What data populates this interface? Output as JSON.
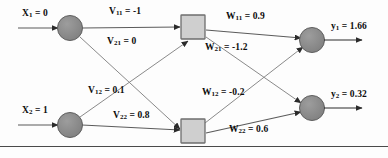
{
  "diagram": {
    "type": "neural-network",
    "colors": {
      "node_fill": "#8c8c8c",
      "node_stroke": "#5a5a5a",
      "hidden_fill": "#cfcfcf",
      "hidden_stroke": "#6e6e6e",
      "edge": "#5b5b5b",
      "text": "#0d0d0d",
      "rule": "#4a4a4a",
      "background": "#fdfdfd"
    },
    "inputs": [
      {
        "id": "x1",
        "name": "X",
        "sub": "1",
        "eq": " = 0",
        "value": 0,
        "cx": 70,
        "cy": 28
      },
      {
        "id": "x2",
        "name": "X",
        "sub": "2",
        "eq": " = 1",
        "value": 1,
        "cx": 70,
        "cy": 125
      }
    ],
    "hidden": [
      {
        "id": "h1",
        "cx": 193,
        "cy": 27,
        "size": 24
      },
      {
        "id": "h2",
        "cx": 193,
        "cy": 131,
        "size": 24
      }
    ],
    "outputs": [
      {
        "id": "y1",
        "name": "y",
        "sub": "1",
        "eq": " = 1.66",
        "value": 1.66,
        "cx": 312,
        "cy": 40
      },
      {
        "id": "y2",
        "name": "y",
        "sub": "2",
        "eq": " = 0.32",
        "value": 0.32,
        "cx": 312,
        "cy": 108
      }
    ],
    "input_arrows": [
      {
        "id": "arrow-x1",
        "x1": 18,
        "y1": 28,
        "x2": 58,
        "y2": 28
      },
      {
        "id": "arrow-x2",
        "x1": 18,
        "y1": 125,
        "x2": 58,
        "y2": 125
      }
    ],
    "output_arrows": [
      {
        "id": "arrow-y1",
        "x1": 324,
        "y1": 40,
        "x2": 364,
        "y2": 40
      },
      {
        "id": "arrow-y2",
        "x1": 324,
        "y1": 108,
        "x2": 364,
        "y2": 108
      }
    ],
    "v_weights": [
      {
        "id": "v11",
        "name": "V",
        "sub": "11",
        "eq": " = -1",
        "value": -1,
        "from": "x1",
        "to": "h1",
        "x1": 82,
        "y1": 28,
        "x2": 180,
        "y2": 27,
        "lx": 110,
        "ly": 8
      },
      {
        "id": "v21",
        "name": "V",
        "sub": "21",
        "eq": " = 0",
        "value": 0,
        "from": "x1",
        "to": "h2",
        "x1": 80,
        "y1": 36,
        "x2": 180,
        "y2": 128,
        "lx": 108,
        "ly": 38
      },
      {
        "id": "v12",
        "name": "V",
        "sub": "12",
        "eq": " = 0.1",
        "value": 0.1,
        "from": "x2",
        "to": "h1",
        "x1": 80,
        "y1": 118,
        "x2": 188,
        "y2": 40,
        "lx": 88,
        "ly": 87
      },
      {
        "id": "v22",
        "name": "V",
        "sub": "22",
        "eq": " = 0.8",
        "value": 0.8,
        "from": "x2",
        "to": "h2",
        "x1": 82,
        "y1": 125,
        "x2": 180,
        "y2": 130,
        "lx": 113,
        "ly": 112
      }
    ],
    "w_weights": [
      {
        "id": "w11",
        "name": "W",
        "sub": "11",
        "eq": " = 0.9",
        "value": 0.9,
        "from": "h1",
        "to": "y1",
        "x1": 206,
        "y1": 30,
        "x2": 300,
        "y2": 38,
        "lx": 228,
        "ly": 13
      },
      {
        "id": "w21",
        "name": "W",
        "sub": "21",
        "eq": " = -1.2",
        "value": -1.2,
        "from": "h1",
        "to": "y2",
        "x1": 206,
        "y1": 36,
        "x2": 300,
        "y2": 104,
        "lx": 207,
        "ly": 43
      },
      {
        "id": "w12",
        "name": "W",
        "sub": "12",
        "eq": " = -0.2",
        "value": -0.2,
        "from": "h2",
        "to": "y1",
        "x1": 204,
        "y1": 124,
        "x2": 302,
        "y2": 46,
        "lx": 203,
        "ly": 88
      },
      {
        "id": "w22",
        "name": "W",
        "sub": "22",
        "eq": " = 0.6",
        "value": 0.6,
        "from": "h2",
        "to": "y2",
        "x1": 206,
        "y1": 133,
        "x2": 300,
        "y2": 112,
        "lx": 230,
        "ly": 126
      }
    ],
    "rule": {
      "y": 146
    }
  }
}
